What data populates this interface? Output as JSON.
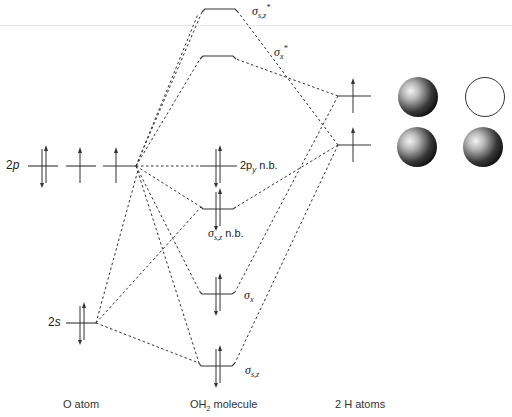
{
  "diagram": {
    "columns": {
      "left": "O atom",
      "center_prefix": "OH",
      "center_sub": "2",
      "center_suffix": " molecule",
      "right": "2 H atoms"
    },
    "o_atom_levels": {
      "p2": {
        "num": "2",
        "letter": "p",
        "electrons": [
          "↑↓",
          "↑",
          "↑"
        ]
      },
      "s2": {
        "num": "2",
        "letter": "s",
        "electrons": [
          "↑↓"
        ]
      }
    },
    "mo_levels": [
      {
        "id": "sigma-sz-star",
        "sym": "σ",
        "sub": "s,z",
        "sup": "*",
        "suffix": "",
        "electrons": ""
      },
      {
        "id": "sigma-x-star",
        "sym": "σ",
        "sub": "x",
        "sup": "*",
        "suffix": "",
        "electrons": ""
      },
      {
        "id": "2py-nb",
        "sym": "2p",
        "sub": "y",
        "sup": "",
        "suffix": " n.b.",
        "electrons": "↑↓"
      },
      {
        "id": "sigma-sz-nb",
        "sym": "σ",
        "sub": "s,z",
        "sup": "",
        "suffix": " n.b.",
        "electrons": "↑↓"
      },
      {
        "id": "sigma-x",
        "sym": "σ",
        "sub": "x",
        "sup": "",
        "suffix": "",
        "electrons": "↑↓"
      },
      {
        "id": "sigma-sz",
        "sym": "σ",
        "sub": "s,z",
        "sup": "",
        "suffix": "",
        "electrons": "↑↓"
      }
    ],
    "h_atom_levels": [
      {
        "id": "h-combination-upper",
        "electrons": "↑",
        "spheres": [
          "filled",
          "empty"
        ]
      },
      {
        "id": "h-combination-lower",
        "electrons": "↑",
        "spheres": [
          "filled",
          "filled"
        ]
      }
    ]
  }
}
